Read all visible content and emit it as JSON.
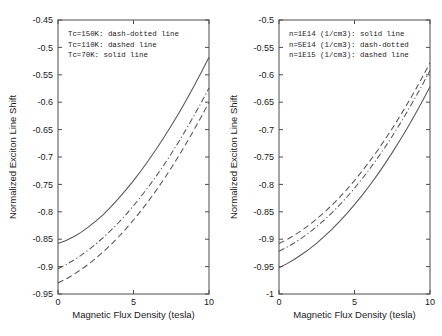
{
  "figure": {
    "background": "#ffffff",
    "curve_color": "#555555",
    "axis_color": "#4d4d4d"
  },
  "chart_data": [
    {
      "type": "line",
      "panel": "left",
      "title": "",
      "xlabel": "Magnetic Flux Density  (tesla)",
      "ylabel": "Normalized Exciton Line Shift",
      "xlim": [
        0,
        10
      ],
      "ylim": [
        -0.95,
        -0.45
      ],
      "xticks": [
        0,
        5,
        10
      ],
      "xticklabels": [
        "0",
        "5",
        "10"
      ],
      "yticks": [
        -0.95,
        -0.9,
        -0.85,
        -0.8,
        -0.75,
        -0.7,
        -0.65,
        -0.6,
        -0.55,
        -0.5,
        -0.45
      ],
      "yticklabels": [
        "-0.95",
        "-0.9",
        "-0.85",
        "-0.8",
        "-0.75",
        "-0.7",
        "-0.65",
        "-0.6",
        "-0.55",
        "-0.5",
        "-0.45"
      ],
      "grid": false,
      "legend_position": "upper-left",
      "legend_entries": [
        "Tc=150K: dash-dotted line",
        "Tc=110K: dashed line",
        "Tc=70K: solid line"
      ],
      "x": [
        0,
        0.5,
        1,
        1.5,
        2,
        2.5,
        3,
        3.5,
        4,
        4.5,
        5,
        5.5,
        6,
        6.5,
        7,
        7.5,
        8,
        8.5,
        9,
        9.5,
        10
      ],
      "series": [
        {
          "name": "Tc=70K",
          "style": "solid",
          "values": [
            -0.858,
            -0.853,
            -0.846,
            -0.838,
            -0.828,
            -0.817,
            -0.805,
            -0.791,
            -0.776,
            -0.76,
            -0.743,
            -0.725,
            -0.706,
            -0.686,
            -0.665,
            -0.643,
            -0.62,
            -0.596,
            -0.571,
            -0.545,
            -0.518
          ]
        },
        {
          "name": "Tc=150K",
          "style": "dash-dotted",
          "values": [
            -0.904,
            -0.897,
            -0.889,
            -0.88,
            -0.87,
            -0.859,
            -0.847,
            -0.834,
            -0.82,
            -0.805,
            -0.789,
            -0.772,
            -0.754,
            -0.735,
            -0.715,
            -0.694,
            -0.672,
            -0.649,
            -0.625,
            -0.6,
            -0.574
          ]
        },
        {
          "name": "Tc=110K",
          "style": "dashed",
          "values": [
            -0.93,
            -0.923,
            -0.915,
            -0.906,
            -0.896,
            -0.885,
            -0.873,
            -0.86,
            -0.846,
            -0.831,
            -0.815,
            -0.798,
            -0.78,
            -0.761,
            -0.741,
            -0.72,
            -0.698,
            -0.675,
            -0.651,
            -0.626,
            -0.6
          ]
        }
      ]
    },
    {
      "type": "line",
      "panel": "right",
      "title": "",
      "xlabel": "Magnetic Flux Density  (tesla)",
      "ylabel": "Normalized Exciton Line Shift",
      "xlim": [
        0,
        10
      ],
      "ylim": [
        -1.0,
        -0.5
      ],
      "xticks": [
        0,
        5,
        10
      ],
      "xticklabels": [
        "0",
        "5",
        "10"
      ],
      "yticks": [
        -1.0,
        -0.95,
        -0.9,
        -0.85,
        -0.8,
        -0.75,
        -0.7,
        -0.65,
        -0.6,
        -0.55,
        -0.5
      ],
      "yticklabels": [
        "-1",
        "-0.95",
        "-0.9",
        "-0.85",
        "-0.8",
        "-0.75",
        "-0.7",
        "-0.65",
        "-0.6",
        "-0.55",
        "-0.5"
      ],
      "grid": false,
      "legend_position": "upper-left",
      "legend_entries": [
        "n=1E14 (1/cm3): solid line",
        "n=5E14 (1/cm3): dash-dotted",
        "n=1E15 (1/cm3): dashed line"
      ],
      "x": [
        0,
        0.5,
        1,
        1.5,
        2,
        2.5,
        3,
        3.5,
        4,
        4.5,
        5,
        5.5,
        6,
        6.5,
        7,
        7.5,
        8,
        8.5,
        9,
        9.5,
        10
      ],
      "series": [
        {
          "name": "n=1E14 (1/cm3)",
          "style": "solid",
          "values": [
            -0.952,
            -0.945,
            -0.937,
            -0.928,
            -0.918,
            -0.907,
            -0.895,
            -0.882,
            -0.868,
            -0.853,
            -0.837,
            -0.82,
            -0.802,
            -0.783,
            -0.763,
            -0.742,
            -0.72,
            -0.697,
            -0.673,
            -0.648,
            -0.622
          ]
        },
        {
          "name": "n=5E14 (1/cm3)",
          "style": "dash-dotted",
          "values": [
            -0.922,
            -0.915,
            -0.907,
            -0.898,
            -0.888,
            -0.877,
            -0.865,
            -0.852,
            -0.838,
            -0.823,
            -0.807,
            -0.79,
            -0.772,
            -0.753,
            -0.733,
            -0.712,
            -0.69,
            -0.667,
            -0.643,
            -0.618,
            -0.592
          ]
        },
        {
          "name": "n=1E15 (1/cm3)",
          "style": "dashed",
          "values": [
            -0.908,
            -0.901,
            -0.893,
            -0.884,
            -0.874,
            -0.863,
            -0.851,
            -0.838,
            -0.824,
            -0.809,
            -0.793,
            -0.776,
            -0.758,
            -0.739,
            -0.719,
            -0.698,
            -0.676,
            -0.653,
            -0.629,
            -0.604,
            -0.578
          ]
        }
      ]
    }
  ]
}
